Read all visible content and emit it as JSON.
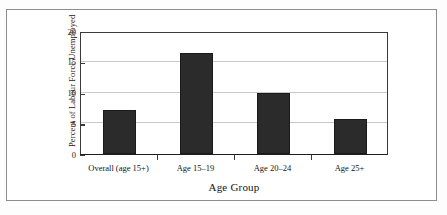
{
  "figure": {
    "clipped_header_text": "",
    "background_color": "#ffffff",
    "border_color": "#8d8d8d",
    "bar_color": "#2b2b2b",
    "grid_color": "#c9c9c9",
    "axis_color": "#3a3a3a"
  },
  "chart_data": {
    "type": "bar",
    "title": "",
    "xlabel": "Age Group",
    "ylabel": "Percent of Labour Force Unemployed",
    "categories": [
      "Overall (age 15+)",
      "Age 15–19",
      "Age 20–24",
      "Age  25+"
    ],
    "values": [
      7.2,
      16.4,
      10.0,
      5.7
    ],
    "ylim": [
      0,
      20
    ],
    "yticks": [
      0,
      5,
      10,
      15,
      20
    ],
    "ytick_labels": [
      "0",
      "5",
      "10",
      "15",
      "20"
    ],
    "grid": "horizontal",
    "legend": "none",
    "series": [
      {
        "name": "Percent of Labour Force Unemployed",
        "values": [
          7.2,
          16.4,
          10.0,
          5.7
        ]
      }
    ]
  }
}
